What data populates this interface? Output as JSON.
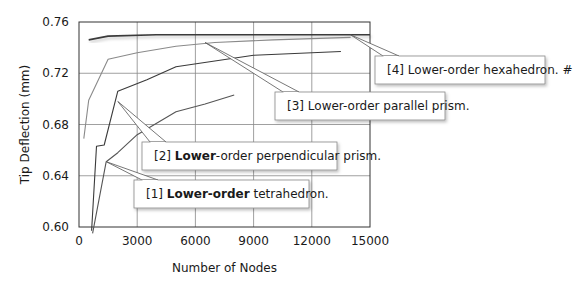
{
  "chart_data": {
    "type": "line",
    "title": "",
    "xlabel": "Number of Nodes",
    "ylabel": "Tip Deflection (mm)",
    "xlim": [
      0,
      15000
    ],
    "ylim": [
      0.6,
      0.76
    ],
    "x_ticks": [
      0,
      3000,
      6000,
      9000,
      12000,
      15000
    ],
    "x_tick_labels": [
      "0",
      "3000",
      "6000",
      "9000",
      "12000",
      "15000"
    ],
    "y_ticks": [
      0.6,
      0.64,
      0.68,
      0.72,
      0.76
    ],
    "y_tick_labels": [
      "0.60",
      "0.64",
      "0.68",
      "0.72",
      "0.76"
    ],
    "grid": true,
    "legend": "callouts",
    "series": [
      {
        "name": "[4] Lower-order hexahedron. #",
        "label_prefix": "[4] ",
        "label_bold": "",
        "label_rest": "Lower-order hexahedron. #",
        "color": "#3a3a3a",
        "x": [
          500,
          1500,
          4000,
          8000,
          15000
        ],
        "y": [
          0.746,
          0.749,
          0.75,
          0.75,
          0.75
        ]
      },
      {
        "name": "[3] Lower-order parallel prism.",
        "label_prefix": "[3] ",
        "label_bold": "",
        "label_rest": "Lower-order parallel prism.",
        "color": "#8a8a8a",
        "x": [
          250,
          500,
          1500,
          3000,
          5000,
          7000,
          10000,
          14000
        ],
        "y": [
          0.669,
          0.699,
          0.731,
          0.736,
          0.741,
          0.744,
          0.746,
          0.748
        ]
      },
      {
        "name": "[2] Lower-order perpendicular prism.",
        "label_prefix": "[2] ",
        "label_bold": "Lower",
        "label_rest": "-order perpendicular prism.",
        "color": "#3a3a3a",
        "x": [
          650,
          900,
          1300,
          2000,
          3500,
          5000,
          9000,
          13500
        ],
        "y": [
          0.597,
          0.663,
          0.664,
          0.706,
          0.715,
          0.725,
          0.734,
          0.737
        ]
      },
      {
        "name": "[1] Lower-order tetrahedron.",
        "label_prefix": "[1] ",
        "label_bold": "Lower-order",
        "label_rest": " tetrahedron.",
        "color": "#555555",
        "x": [
          700,
          1400,
          2000,
          3000,
          5000,
          6500,
          8000
        ],
        "y": [
          0.595,
          0.651,
          0.658,
          0.672,
          0.69,
          0.696,
          0.703
        ]
      }
    ],
    "callouts": [
      {
        "series": 0,
        "anchor_x": 14000,
        "anchor_y": 0.75
      },
      {
        "series": 1,
        "anchor_x": 6500,
        "anchor_y": 0.744
      },
      {
        "series": 2,
        "anchor_x": 2000,
        "anchor_y": 0.698
      },
      {
        "series": 3,
        "anchor_x": 1400,
        "anchor_y": 0.651
      }
    ]
  }
}
